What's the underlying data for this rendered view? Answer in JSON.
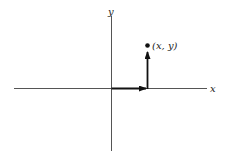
{
  "diagram": {
    "type": "coordinate-plane",
    "axes": {
      "x_label": "x",
      "y_label": "y"
    },
    "point": {
      "label": "(x, y)"
    },
    "vectors": [
      {
        "name": "horizontal-component",
        "direction": "right"
      },
      {
        "name": "vertical-component",
        "direction": "up"
      }
    ],
    "colors": {
      "axis": "#444444",
      "vector": "#111111",
      "background": "#ffffff"
    }
  }
}
